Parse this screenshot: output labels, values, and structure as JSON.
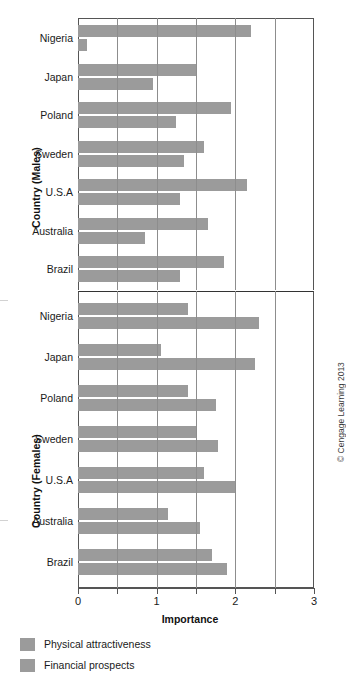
{
  "chart_data": {
    "type": "bar",
    "orientation": "horizontal",
    "title": "",
    "xlabel": "Importance",
    "xlim": [
      0,
      3
    ],
    "xticks": [
      0,
      0.5,
      1,
      1.5,
      2,
      2.5,
      3
    ],
    "xtick_labels": [
      "0",
      "",
      "1",
      "",
      "2",
      "",
      "3"
    ],
    "grid": true,
    "gridlines_at": [
      0.5,
      1,
      1.5,
      2,
      2.5
    ],
    "legend_position": "bottom-left",
    "series_names": [
      "Physical attractiveness",
      "Financial prospects"
    ],
    "bar_color": "#9b9b9b",
    "panels": [
      {
        "ylabel": "Country (Males)",
        "categories": [
          "Nigeria",
          "Japan",
          "Poland",
          "Sweden",
          "U.S.A",
          "Australia",
          "Brazil"
        ],
        "series": [
          {
            "name": "Physical attractiveness",
            "values": [
              2.2,
              1.5,
              1.95,
              1.6,
              2.15,
              1.65,
              1.85
            ]
          },
          {
            "name": "Financial prospects",
            "values": [
              0.12,
              0.95,
              1.25,
              1.35,
              1.3,
              0.85,
              1.3
            ]
          }
        ]
      },
      {
        "ylabel": "Country (Females)",
        "categories": [
          "Nigeria",
          "Japan",
          "Poland",
          "Sweden",
          "U.S.A",
          "Australia",
          "Brazil"
        ],
        "series": [
          {
            "name": "Physical attractiveness",
            "values": [
              1.4,
              1.05,
              1.4,
              1.5,
              1.6,
              1.15,
              1.7
            ]
          },
          {
            "name": "Financial prospects",
            "values": [
              2.3,
              2.25,
              1.75,
              1.78,
              2.0,
              1.55,
              1.9
            ]
          }
        ]
      }
    ]
  },
  "legend": {
    "items": [
      {
        "label": "Physical attractiveness",
        "color": "#9b9b9b"
      },
      {
        "label": "Financial prospects",
        "color": "#9b9b9b"
      }
    ]
  },
  "credit": "© Cengage Learning 2013"
}
